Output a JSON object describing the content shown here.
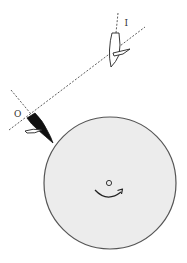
{
  "diagram": {
    "labels": {
      "incoming_tool": "I",
      "outgoing_tool": "O"
    },
    "colors": {
      "disk_fill": "#ececec",
      "disk_stroke": "#555555",
      "ink": "#222222",
      "dash": "#333333",
      "background": "#ffffff"
    },
    "rotation_direction": "counter-clockwise-arrow-bottom"
  }
}
